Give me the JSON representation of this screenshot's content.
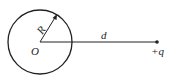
{
  "diagram": {
    "labels": {
      "radius": "R",
      "center": "O",
      "distance": "d",
      "charge": "+q"
    },
    "colors": {
      "stroke": "#222222",
      "background": "#ffffff"
    }
  }
}
